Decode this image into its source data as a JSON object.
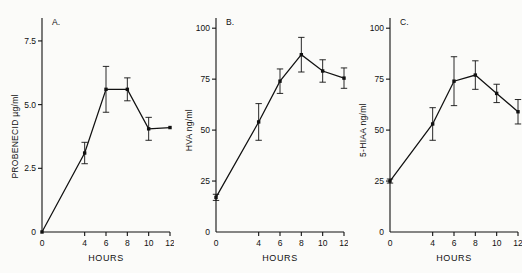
{
  "figure": {
    "background_color": "#fbfbf9",
    "ink_color": "#111111",
    "panel_count": 3
  },
  "chart_data": [
    {
      "type": "line",
      "panel_letter": "A.",
      "title": "",
      "xlabel": "HOURS",
      "ylabel": "PROBENECID  µg/ml",
      "x": [
        0,
        4,
        6,
        8,
        10,
        12
      ],
      "values": [
        0.0,
        3.1,
        5.6,
        5.6,
        4.05,
        4.1
      ],
      "errors": [
        0.0,
        0.42,
        0.9,
        0.45,
        0.45,
        0.0
      ],
      "xticks": [
        0,
        4,
        6,
        8,
        10,
        12
      ],
      "xticklabels": [
        "0",
        "4",
        "6",
        "8",
        "10",
        "12"
      ],
      "yticks": [
        0,
        2.5,
        5.0,
        7.5
      ],
      "yticklabels": [
        "0",
        "2.5",
        "5.0",
        "7.5"
      ],
      "xlim": [
        0,
        12
      ],
      "ylim": [
        0,
        8.4
      ],
      "grid": false,
      "legend": "none"
    },
    {
      "type": "line",
      "panel_letter": "B.",
      "title": "",
      "xlabel": "HOURS",
      "ylabel": "HVA  ng/ml",
      "x": [
        0,
        4,
        6,
        8,
        10,
        12
      ],
      "values": [
        17,
        54,
        74,
        87,
        79,
        75.5
      ],
      "errors": [
        1.5,
        9.0,
        6.0,
        8.5,
        5.5,
        5.0
      ],
      "xticks": [
        0,
        4,
        6,
        8,
        10,
        12
      ],
      "xticklabels": [
        "0",
        "4",
        "6",
        "8",
        "10",
        "12"
      ],
      "yticks": [
        0,
        25,
        50,
        75,
        100
      ],
      "yticklabels": [
        "0",
        "25",
        "50",
        "75",
        "100"
      ],
      "xlim": [
        0,
        12
      ],
      "ylim": [
        0,
        105
      ],
      "grid": false,
      "legend": "none"
    },
    {
      "type": "line",
      "panel_letter": "C.",
      "title": "",
      "xlabel": "HOURS",
      "ylabel": "5-HIAA  ng/ml",
      "x": [
        0,
        4,
        6,
        8,
        10,
        12
      ],
      "values": [
        25,
        53,
        74,
        77,
        68,
        59
      ],
      "errors": [
        1.0,
        8.0,
        12.0,
        7.0,
        4.5,
        6.0
      ],
      "xticks": [
        0,
        4,
        6,
        8,
        10,
        12
      ],
      "xticklabels": [
        "0",
        "4",
        "6",
        "8",
        "10",
        "12"
      ],
      "yticks": [
        0,
        25,
        50,
        75,
        100
      ],
      "yticklabels": [
        "0",
        "25",
        "50",
        "75",
        "100"
      ],
      "xlim": [
        0,
        12
      ],
      "ylim": [
        0,
        105
      ],
      "grid": false,
      "legend": "none"
    }
  ]
}
